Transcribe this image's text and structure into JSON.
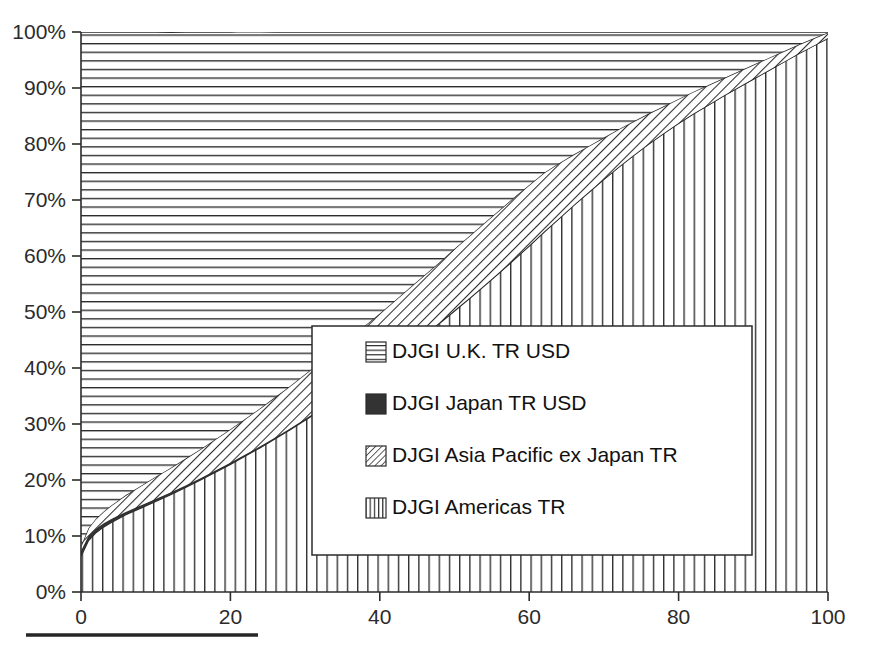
{
  "chart_data": {
    "type": "area",
    "title": "",
    "subtitle": "",
    "xlabel": "",
    "ylabel": "",
    "stacked": true,
    "normalized": true,
    "grid": false,
    "legend_position": "inside-center-right",
    "xlim": [
      0,
      100
    ],
    "ylim": [
      0,
      100
    ],
    "xticks": [
      0,
      20,
      40,
      60,
      80,
      100
    ],
    "xtick_labels": [
      "0",
      "20",
      "40",
      "60",
      "80",
      "100"
    ],
    "yticks": [
      0,
      10,
      20,
      30,
      40,
      50,
      60,
      70,
      80,
      90,
      100
    ],
    "ytick_labels": [
      "0%",
      "10%",
      "20%",
      "30%",
      "40%",
      "50%",
      "60%",
      "70%",
      "80%",
      "90%",
      "100%"
    ],
    "x": [
      0,
      1,
      2,
      3,
      4,
      5,
      6,
      8,
      10,
      12,
      14,
      16,
      18,
      20,
      22,
      24,
      26,
      28,
      30,
      32,
      34,
      36,
      38,
      40,
      42,
      44,
      46,
      48,
      50,
      52,
      54,
      56,
      58,
      60,
      62,
      64,
      66,
      68,
      70,
      72,
      74,
      76,
      78,
      80,
      82,
      84,
      86,
      88,
      90,
      92,
      94,
      96,
      98,
      100
    ],
    "series": [
      {
        "name": "DJGI Americas TR",
        "pattern": "vertical-lines",
        "order": 1,
        "values": [
          6.4,
          9.2,
          10.6,
          11.6,
          12.4,
          13.1,
          13.8,
          15.0,
          16.2,
          17.4,
          18.7,
          20.0,
          21.4,
          22.8,
          24.3,
          25.8,
          27.4,
          29.0,
          30.7,
          32.4,
          34.2,
          36.0,
          37.9,
          39.8,
          41.8,
          43.8,
          45.9,
          48.0,
          50.2,
          52.4,
          54.7,
          57.0,
          59.4,
          61.8,
          64.3,
          66.7,
          69.1,
          71.4,
          73.7,
          75.9,
          78.0,
          80.0,
          81.9,
          83.7,
          85.4,
          87.0,
          88.6,
          90.1,
          91.6,
          93.1,
          94.6,
          96.1,
          97.5,
          98.9
        ]
      },
      {
        "name": "DJGI Japan TR USD",
        "pattern": "solid-dark",
        "order": 2,
        "values": [
          0.9,
          0.8,
          0.7,
          0.65,
          0.6,
          0.55,
          0.5,
          0.45,
          0.4,
          0.36,
          0.33,
          0.3,
          0.28,
          0.26,
          0.24,
          0.22,
          0.2,
          0.19,
          0.18,
          0.17,
          0.16,
          0.15,
          0.14,
          0.13,
          0.12,
          0.12,
          0.11,
          0.1,
          0.1,
          0.09,
          0.09,
          0.08,
          0.08,
          0.07,
          0.07,
          0.06,
          0.06,
          0.06,
          0.05,
          0.05,
          0.05,
          0.04,
          0.04,
          0.04,
          0.04,
          0.03,
          0.03,
          0.03,
          0.03,
          0.02,
          0.02,
          0.02,
          0.02,
          0.02
        ]
      },
      {
        "name": "DJGI Asia Pacific ex Japan TR",
        "pattern": "diagonal-hatch",
        "order": 3,
        "values": [
          0.9,
          1.4,
          1.8,
          2.1,
          2.4,
          2.7,
          3.0,
          3.5,
          4.0,
          4.4,
          4.8,
          5.2,
          5.6,
          6.0,
          6.4,
          6.8,
          7.2,
          7.6,
          8.0,
          8.4,
          8.8,
          9.1,
          9.5,
          9.8,
          10.1,
          10.4,
          10.6,
          10.8,
          11.0,
          11.1,
          11.1,
          11.1,
          11.0,
          10.8,
          10.5,
          9.8,
          9.0,
          8.2,
          7.4,
          6.7,
          6.0,
          5.4,
          4.8,
          4.3,
          3.9,
          3.5,
          3.1,
          2.8,
          2.5,
          2.2,
          1.9,
          1.6,
          1.3,
          1.0
        ]
      },
      {
        "name": "DJGI U.K. TR USD",
        "pattern": "horizontal-lines",
        "order": 4,
        "values": [
          91.8,
          88.6,
          86.9,
          85.65,
          84.6,
          83.65,
          82.7,
          81.05,
          79.4,
          77.8,
          76.17,
          74.5,
          72.72,
          70.94,
          69.12,
          67.2,
          65.2,
          63.21,
          61.12,
          59.03,
          56.84,
          54.75,
          52.46,
          50.27,
          47.98,
          45.68,
          43.39,
          41.1,
          38.7,
          36.41,
          34.11,
          31.82,
          29.52,
          27.33,
          25.13,
          23.44,
          21.84,
          20.34,
          18.85,
          17.35,
          15.95,
          14.56,
          13.26,
          11.96,
          10.66,
          9.47,
          8.27,
          7.07,
          5.87,
          4.68,
          3.48,
          2.28,
          1.18,
          0.08
        ]
      }
    ],
    "annotations": []
  },
  "legend": {
    "entries": [
      {
        "label": "DJGI U.K. TR USD",
        "pattern": "horizontal-lines"
      },
      {
        "label": "DJGI Japan TR USD",
        "pattern": "solid-dark"
      },
      {
        "label": "DJGI Asia Pacific ex Japan TR",
        "pattern": "diagonal-hatch"
      },
      {
        "label": "DJGI Americas TR",
        "pattern": "vertical-lines"
      }
    ]
  },
  "colors": {
    "axis": "#2b2b2b",
    "text": "#111111",
    "japan_fill": "#333333",
    "background": "#ffffff",
    "rule": "#262626"
  },
  "footer": {
    "rule_visible": true
  }
}
